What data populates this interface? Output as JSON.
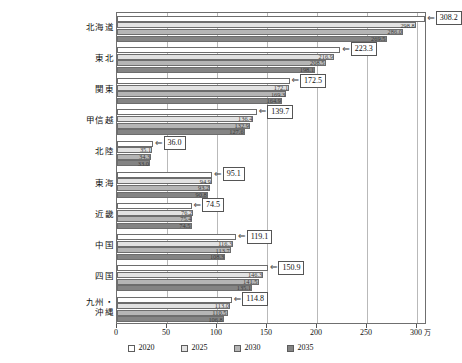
{
  "chart_data": {
    "type": "bar",
    "orientation": "horizontal",
    "title": "",
    "xlabel": "",
    "ylabel": "",
    "unit": "万",
    "xlim": [
      0,
      310
    ],
    "xticks": [
      0,
      50,
      100,
      150,
      200,
      250,
      300
    ],
    "grid": true,
    "legend_position": "bottom",
    "categories": [
      "北海道",
      "東北",
      "関東",
      "甲信越",
      "北陸",
      "東海",
      "近畿",
      "中国",
      "四国",
      "九州・沖縄"
    ],
    "series": [
      {
        "name": "2020",
        "color": "#ffffff",
        "values": [
          308.2,
          223.3,
          172.5,
          139.7,
          36.0,
          95.1,
          74.5,
          119.1,
          150.9,
          114.8
        ]
      },
      {
        "name": "2025",
        "color": "#e2e2e2",
        "values": [
          298.8,
          216.9,
          172.1,
          136.4,
          35.1,
          94.9,
          76.2,
          116.3,
          146.3,
          113.0
        ]
      },
      {
        "name": "2030",
        "color": "#b5b5b5",
        "values": [
          286.0,
          208.5,
          169.3,
          132.9,
          34.3,
          93.2,
          75.4,
          113.7,
          141.5,
          110.5
        ]
      },
      {
        "name": "2035",
        "color": "#848484",
        "values": [
          269.5,
          198.1,
          164.9,
          127.6,
          33.0,
          90.8,
          74.5,
          108.3,
          135.1,
          106.8
        ]
      }
    ],
    "callout_labels": [
      "308.2",
      "223.3",
      "172.5",
      "139.7",
      "36.0",
      "95.1",
      "74.5",
      "119.1",
      "150.9",
      "114.8"
    ],
    "inline_labels": [
      [
        "298.8",
        "286.0",
        "269.5"
      ],
      [
        "216.9",
        "208.5",
        "198.1"
      ],
      [
        "172.1",
        "169.3",
        "164.9"
      ],
      [
        "136.4",
        "132.9",
        "127.6"
      ],
      [
        "35.1",
        "34.3",
        "33.0"
      ],
      [
        "94.9",
        "93.2",
        "90.8"
      ],
      [
        "76.2",
        "75.4",
        "74.5"
      ],
      [
        "116.3",
        "113.7",
        "108.3"
      ],
      [
        "146.3",
        "141.5",
        "135.1"
      ],
      [
        "113.0",
        "110.5",
        "106.8"
      ]
    ]
  },
  "legend": {
    "items": [
      {
        "label": "2020",
        "color": "#ffffff"
      },
      {
        "label": "2025",
        "color": "#e2e2e2"
      },
      {
        "label": "2030",
        "color": "#b5b5b5"
      },
      {
        "label": "2035",
        "color": "#848484"
      }
    ]
  },
  "axis": {
    "x_unit": "万",
    "x_tick_labels": [
      "0",
      "50",
      "100",
      "150",
      "200",
      "250",
      "300"
    ]
  }
}
